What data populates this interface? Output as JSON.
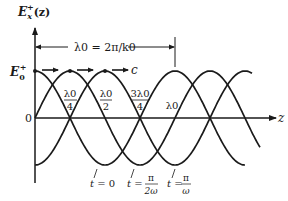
{
  "diagram": {
    "y_axis_label": "E",
    "y_axis_sub": "x",
    "y_axis_sup": "+",
    "y_axis_arg": "(z)",
    "x_axis_label": "z",
    "amplitude_label": "E",
    "amplitude_sub": "0",
    "amplitude_sup": "+",
    "zero_label": "0",
    "wavelength_annotation": "λ0 = 2π/k0",
    "velocity_label": "c",
    "markers": [
      {
        "num": "λ0",
        "den": "4"
      },
      {
        "num": "λ0",
        "den": "2"
      },
      {
        "num": "3λ0",
        "den": "4"
      },
      {
        "num": "λ0",
        "den": ""
      }
    ],
    "curves": [
      {
        "label_pre": "t = ",
        "label_num": "0",
        "label_den": ""
      },
      {
        "label_pre": "t = ",
        "label_num": "π",
        "label_den": "2ω"
      },
      {
        "label_pre": "t = ",
        "label_num": "π",
        "label_den": "ω"
      }
    ],
    "line_color": "#1a1a1a"
  }
}
